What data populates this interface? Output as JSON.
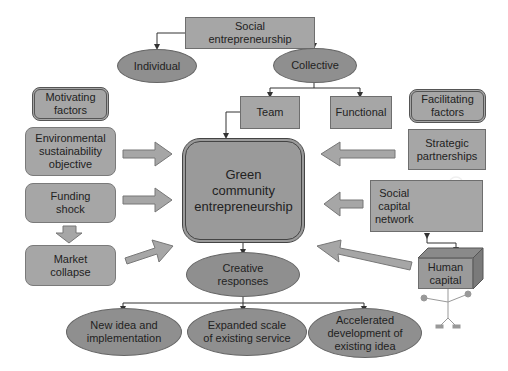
{
  "diagram": {
    "top": {
      "social_entrepreneurship": "Social\nentrepreneurship",
      "individual": "Individual",
      "collective": "Collective",
      "team": "Team",
      "functional": "Functional"
    },
    "left": {
      "header": "Motivating\nfactors",
      "items": [
        "Environmental\nsustainability\nobjective",
        "Funding\nshock",
        "Market\ncollapse"
      ]
    },
    "right": {
      "header": "Facilitating\nfactors",
      "strategic": "Strategic\npartnerships",
      "social_capital": "Social\ncapital\nnetwork",
      "human_capital": "Human\ncapital"
    },
    "center": "Green\ncommunity\nentrepreneurship",
    "creative": "Creative\nresponses",
    "outcomes": [
      "New idea and\nimplementation",
      "Expanded scale\nof existing service",
      "Accelerated\ndevelopment of\nexisting idea"
    ],
    "colors": {
      "box_fill": "#a6a6a6",
      "ellipse_fill": "#8f8f8f",
      "center_fill": "#9a9a9a",
      "line": "#333333"
    }
  }
}
